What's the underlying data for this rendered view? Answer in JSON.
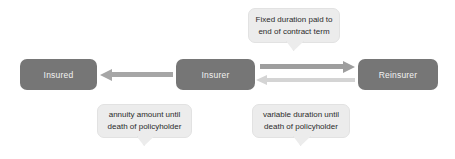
{
  "diagram": {
    "colors": {
      "node_fill": "#767676",
      "node_text": "#f2f2f2",
      "callout_fill": "#ececec",
      "callout_text": "#2b2b2b",
      "arrow_mid": "#a6a6a6",
      "arrow_light": "#d4d4d4",
      "background": "#ffffff"
    },
    "nodes": [
      {
        "id": "insured",
        "label": "Insured"
      },
      {
        "id": "insurer",
        "label": "Insurer"
      },
      {
        "id": "reinsurer",
        "label": "Reinsurer"
      }
    ],
    "callouts": [
      {
        "id": "fixed",
        "line1": "Fixed duration paid to",
        "line2": "end of contract term"
      },
      {
        "id": "annuity",
        "line1": "annuity amount until",
        "line2": "death of policyholder"
      },
      {
        "id": "variable",
        "line1": "variable duration until",
        "line2": "death of policyholder"
      }
    ],
    "arrows": [
      {
        "id": "annuity-flow",
        "from": "insurer",
        "to": "insured",
        "direction": "left"
      },
      {
        "id": "premium-flow",
        "from": "insurer",
        "to": "reinsurer",
        "direction": "right"
      },
      {
        "id": "claims-flow",
        "from": "reinsurer",
        "to": "insurer",
        "direction": "left"
      }
    ]
  }
}
